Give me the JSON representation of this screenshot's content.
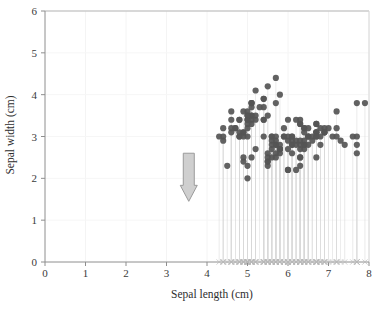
{
  "chart_data": {
    "type": "scatter",
    "title": "",
    "xlabel": "Sepal length (cm)",
    "ylabel": "Sepal width (cm)",
    "xlim": [
      0,
      8
    ],
    "ylim": [
      0,
      6
    ],
    "xticks": [
      0,
      1,
      2,
      3,
      4,
      5,
      6,
      7,
      8
    ],
    "yticks": [
      0,
      1,
      2,
      3,
      4,
      5,
      6
    ],
    "xticklabels": [
      "0",
      "1",
      "2",
      "3",
      "4",
      "5",
      "6",
      "7",
      "8"
    ],
    "yticklabels": [
      "0",
      "1",
      "2",
      "3",
      "4",
      "5",
      "6"
    ],
    "grid": true,
    "legend": "none",
    "marker": "circle",
    "marker_color": "#555555",
    "marker_size": 4.2,
    "stem_color": "#d8d8d8",
    "baseline_marker": "x",
    "baseline_marker_color": "#b8b8b8",
    "baseline_y": 0,
    "annotations": [
      {
        "name": "down-arrow",
        "shape": "arrow-down",
        "x": 3.55,
        "y_top": 2.6,
        "y_bottom": 1.45,
        "fill": "#cfcfcf",
        "stroke": "#9a9a9a"
      }
    ],
    "series": [
      {
        "name": "iris sepal measurements",
        "x": [
          5.1,
          4.9,
          4.7,
          4.6,
          5.0,
          5.4,
          4.6,
          5.0,
          4.4,
          4.9,
          5.4,
          4.8,
          4.8,
          4.3,
          5.8,
          5.7,
          5.4,
          5.1,
          5.7,
          5.1,
          5.4,
          5.1,
          4.6,
          5.1,
          4.8,
          5.0,
          5.0,
          5.2,
          5.2,
          4.7,
          4.8,
          5.4,
          5.2,
          5.5,
          4.9,
          5.0,
          5.5,
          4.9,
          4.4,
          5.1,
          5.0,
          4.5,
          4.4,
          5.0,
          5.1,
          4.8,
          5.1,
          4.6,
          5.3,
          5.0,
          7.0,
          6.4,
          6.9,
          5.5,
          6.5,
          5.7,
          6.3,
          4.9,
          6.6,
          5.2,
          5.0,
          5.9,
          6.0,
          6.1,
          5.6,
          6.7,
          5.6,
          5.8,
          6.2,
          5.6,
          5.9,
          6.1,
          6.3,
          6.1,
          6.4,
          6.6,
          6.8,
          6.7,
          6.0,
          5.7,
          5.5,
          5.5,
          5.8,
          6.0,
          5.4,
          6.0,
          6.7,
          6.3,
          5.6,
          5.5,
          5.5,
          6.1,
          5.8,
          5.0,
          5.6,
          5.7,
          5.7,
          6.2,
          5.1,
          5.7,
          6.3,
          5.8,
          7.1,
          6.3,
          6.5,
          7.6,
          4.9,
          7.3,
          6.7,
          7.2,
          6.5,
          6.4,
          6.8,
          5.7,
          5.8,
          6.4,
          6.5,
          7.7,
          7.7,
          6.0,
          6.9,
          5.6,
          7.7,
          6.3,
          6.7,
          7.2,
          6.2,
          6.1,
          6.4,
          7.2,
          7.4,
          7.9,
          6.4,
          6.3,
          6.1,
          7.7,
          6.3,
          6.4,
          6.0,
          6.9,
          6.7,
          6.9,
          5.8,
          6.8,
          6.7,
          6.7,
          6.3,
          6.5,
          6.2,
          5.9
        ],
        "y": [
          3.5,
          3.0,
          3.2,
          3.1,
          3.6,
          3.9,
          3.4,
          3.4,
          2.9,
          3.1,
          3.7,
          3.4,
          3.0,
          3.0,
          4.0,
          4.4,
          3.9,
          3.5,
          3.8,
          3.8,
          3.4,
          3.7,
          3.6,
          3.3,
          3.4,
          3.0,
          3.4,
          3.5,
          3.4,
          3.2,
          3.1,
          3.4,
          4.1,
          4.2,
          3.1,
          3.2,
          3.5,
          3.6,
          3.0,
          3.4,
          3.5,
          2.3,
          3.2,
          3.5,
          3.8,
          3.0,
          3.8,
          3.2,
          3.7,
          3.3,
          3.2,
          3.2,
          3.1,
          2.3,
          2.8,
          2.8,
          3.3,
          2.4,
          2.9,
          2.7,
          2.0,
          3.0,
          2.2,
          2.9,
          2.9,
          3.1,
          3.0,
          2.7,
          2.2,
          2.5,
          3.2,
          2.8,
          2.5,
          2.8,
          2.9,
          3.0,
          2.8,
          3.0,
          2.9,
          2.6,
          2.4,
          2.4,
          2.7,
          2.7,
          3.0,
          3.4,
          3.1,
          2.3,
          3.0,
          2.5,
          2.6,
          3.0,
          2.6,
          2.3,
          2.7,
          3.0,
          2.9,
          2.9,
          2.5,
          2.8,
          3.3,
          2.7,
          3.0,
          2.9,
          3.0,
          3.0,
          2.5,
          2.9,
          2.5,
          3.6,
          3.2,
          2.7,
          3.0,
          2.5,
          2.8,
          3.2,
          3.0,
          3.8,
          2.6,
          2.2,
          3.2,
          2.8,
          2.8,
          2.7,
          3.3,
          3.2,
          2.8,
          3.0,
          2.8,
          3.0,
          2.8,
          3.8,
          2.8,
          2.8,
          2.6,
          3.0,
          3.4,
          3.1,
          3.0,
          3.1,
          3.1,
          3.1,
          2.7,
          3.2,
          3.3,
          3.0,
          2.5,
          3.0,
          3.4,
          3.0
        ]
      }
    ]
  }
}
